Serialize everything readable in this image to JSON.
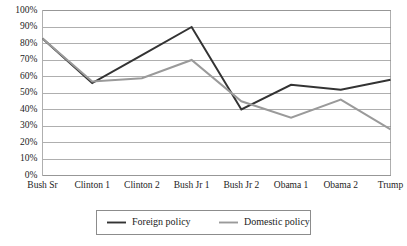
{
  "chart_data": {
    "type": "line",
    "title": "",
    "xlabel": "",
    "ylabel": "",
    "ylim": [
      0,
      1.0
    ],
    "grid": true,
    "legend_position": "bottom",
    "categories": [
      "Bush Sr",
      "Clinton 1",
      "Clinton 2",
      "Bush Jr 1",
      "Bush Jr 2",
      "Obama 1",
      "Obama 2",
      "Trump"
    ],
    "ytick_labels": [
      "100%",
      "90%",
      "80%",
      "70%",
      "60%",
      "50%",
      "40%",
      "30%",
      "20%",
      "10%",
      "0%"
    ],
    "ytick_values": [
      100,
      90,
      80,
      70,
      60,
      50,
      40,
      30,
      20,
      10,
      0
    ],
    "series": [
      {
        "name": "Foreign policy",
        "color": "#333333",
        "width": 2.0,
        "values": [
          83,
          56,
          73,
          90,
          40,
          55,
          52,
          58
        ]
      },
      {
        "name": "Domestic policy",
        "color": "#9a9a9a",
        "width": 2.0,
        "values": [
          83,
          57,
          59,
          70,
          45,
          35,
          46,
          28
        ]
      }
    ]
  },
  "legend": {
    "entries": [
      {
        "label": "Foreign policy",
        "color": "#333333"
      },
      {
        "label": "Domestic policy",
        "color": "#9a9a9a"
      }
    ]
  }
}
